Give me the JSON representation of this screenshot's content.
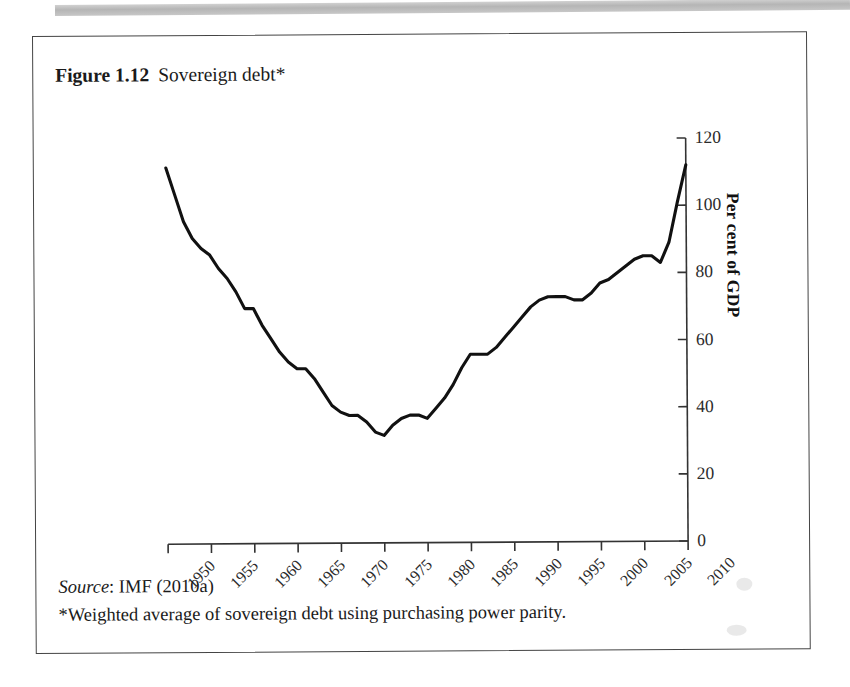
{
  "figure": {
    "number": "Figure 1.12",
    "caption": "Sovereign debt*",
    "source_label": "Source",
    "source_text": ": IMF (2010a)",
    "footnote": "*Weighted average of sovereign debt using purchasing power parity."
  },
  "chart_data": {
    "type": "line",
    "title": "Sovereign debt*",
    "xlabel": "",
    "ylabel": "Per cent of GDP",
    "xlim": [
      1950,
      2010
    ],
    "ylim": [
      0,
      120
    ],
    "grid": false,
    "legend": null,
    "line_color": "#111111",
    "xticks": [
      1950,
      1955,
      1960,
      1965,
      1970,
      1975,
      1980,
      1985,
      1990,
      1995,
      2000,
      2005,
      2010
    ],
    "xtick_labels": [
      "1950",
      "1955",
      "1960",
      "1965",
      "1970",
      "1975",
      "1980",
      "1985",
      "1990",
      "1995",
      "2000",
      "2005",
      "2010"
    ],
    "yticks": [
      0,
      20,
      40,
      60,
      80,
      100,
      120
    ],
    "ytick_labels": [
      "0",
      "20",
      "40",
      "60",
      "80",
      "100",
      "120"
    ],
    "x": [
      1950,
      1951,
      1952,
      1953,
      1954,
      1955,
      1956,
      1957,
      1958,
      1959,
      1960,
      1961,
      1962,
      1963,
      1964,
      1965,
      1966,
      1967,
      1968,
      1969,
      1970,
      1971,
      1972,
      1973,
      1974,
      1975,
      1976,
      1977,
      1978,
      1979,
      1980,
      1981,
      1982,
      1983,
      1984,
      1985,
      1986,
      1987,
      1988,
      1989,
      1990,
      1991,
      1992,
      1993,
      1994,
      1995,
      1996,
      1997,
      1998,
      1999,
      2000,
      2001,
      2002,
      2003,
      2004,
      2005,
      2006,
      2007,
      2008,
      2009,
      2010
    ],
    "values": [
      112,
      104,
      96,
      91,
      88,
      86,
      82,
      79,
      75,
      70,
      70,
      65,
      61,
      57,
      54,
      52,
      52,
      49,
      45,
      41,
      39,
      38,
      38,
      36,
      33,
      32,
      35,
      37,
      38,
      38,
      37,
      40,
      43,
      47,
      52,
      56,
      56,
      56,
      58,
      61,
      64,
      67,
      70,
      72,
      73,
      73,
      73,
      72,
      72,
      74,
      77,
      78,
      80,
      82,
      84,
      85,
      85,
      83,
      89,
      101,
      112
    ]
  }
}
